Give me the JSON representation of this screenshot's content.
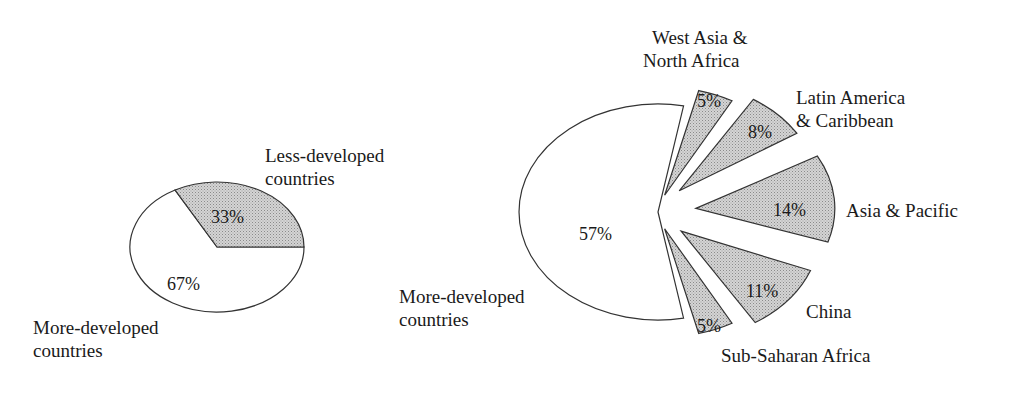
{
  "chart_data": [
    {
      "type": "pie",
      "title": "",
      "slices": [
        {
          "label": "Less-developed countries",
          "value": 33,
          "value_label": "33%",
          "fill": "pattern-gray"
        },
        {
          "label": "More-developed countries",
          "value": 67,
          "value_label": "67%",
          "fill": "white"
        }
      ],
      "labels": {
        "less_line1": "Less-developed",
        "less_line2": "countries",
        "more_line1": "More-developed",
        "more_line2": "countries"
      }
    },
    {
      "type": "pie",
      "title": "",
      "exploded": true,
      "slices": [
        {
          "label": "More-developed countries",
          "value": 57,
          "value_label": "57%",
          "fill": "white"
        },
        {
          "label": "West Asia & North Africa",
          "value": 5,
          "value_label": "5%",
          "fill": "pattern-gray"
        },
        {
          "label": "Latin America & Caribbean",
          "value": 8,
          "value_label": "8%",
          "fill": "pattern-gray"
        },
        {
          "label": "Asia & Pacific",
          "value": 14,
          "value_label": "14%",
          "fill": "pattern-gray"
        },
        {
          "label": "China",
          "value": 11,
          "value_label": "11%",
          "fill": "pattern-gray"
        },
        {
          "label": "Sub-Saharan Africa",
          "value": 5,
          "value_label": "5%",
          "fill": "pattern-gray"
        }
      ],
      "labels": {
        "more_line1": "More-developed",
        "more_line2": "countries",
        "wana_line1": "West Asia &",
        "wana_line2": "North Africa",
        "lac_line1": "Latin America",
        "lac_line2": "& Caribbean",
        "ap": "Asia & Pacific",
        "china": "China",
        "ssa": "Sub-Saharan Africa"
      }
    }
  ],
  "colors": {
    "shaded_fill": "#cfcfcf",
    "stroke": "#333333",
    "text": "#1a1a1a"
  }
}
